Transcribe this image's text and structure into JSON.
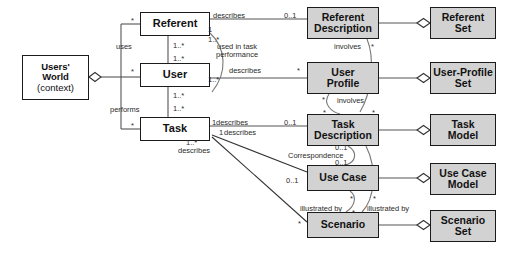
{
  "diagram": {
    "style": {
      "line_color": "#555555",
      "border_color": "#1b1b1b",
      "shaded_fill": "#d2d2d2",
      "plain_fill": "#ffffff",
      "background": "#ffffff"
    },
    "nodes": [
      {
        "id": "users_world",
        "label": "Users'",
        "label2": "World",
        "label3": "(context)",
        "shaded": false,
        "x": 22,
        "y": 55,
        "w": 67,
        "h": 45,
        "font": 9.5
      },
      {
        "id": "referent",
        "label": "Referent",
        "shaded": false,
        "x": 140,
        "y": 12,
        "w": 70,
        "h": 24,
        "font": 11
      },
      {
        "id": "user",
        "label": "User",
        "shaded": false,
        "x": 140,
        "y": 63,
        "w": 70,
        "h": 24,
        "font": 11
      },
      {
        "id": "task",
        "label": "Task",
        "shaded": false,
        "x": 140,
        "y": 117,
        "w": 70,
        "h": 24,
        "font": 11
      },
      {
        "id": "referent_desc",
        "label": "Referent",
        "label2": "Description",
        "shaded": true,
        "x": 307,
        "y": 7,
        "w": 72,
        "h": 32,
        "font": 10.5
      },
      {
        "id": "user_profile",
        "label": "User",
        "label2": "Profile",
        "shaded": true,
        "x": 307,
        "y": 62,
        "w": 72,
        "h": 32,
        "font": 10.5
      },
      {
        "id": "task_desc",
        "label": "Task",
        "label2": "Description",
        "shaded": true,
        "x": 307,
        "y": 114,
        "w": 72,
        "h": 32,
        "font": 10.5
      },
      {
        "id": "use_case",
        "label": "Use Case",
        "shaded": true,
        "x": 307,
        "y": 165,
        "w": 72,
        "h": 26,
        "font": 10.5
      },
      {
        "id": "scenario",
        "label": "Scenario",
        "shaded": true,
        "x": 307,
        "y": 212,
        "w": 72,
        "h": 26,
        "font": 10.5
      },
      {
        "id": "referent_set",
        "label": "Referent",
        "label2": "Set",
        "shaded": true,
        "x": 430,
        "y": 7,
        "w": 66,
        "h": 32,
        "font": 10.5
      },
      {
        "id": "user_profile_set",
        "label": "User-Profile",
        "label2": "Set",
        "shaded": true,
        "x": 430,
        "y": 62,
        "w": 66,
        "h": 32,
        "font": 10.5
      },
      {
        "id": "task_model",
        "label": "Task",
        "label2": "Model",
        "shaded": true,
        "x": 430,
        "y": 114,
        "w": 66,
        "h": 32,
        "font": 10.5
      },
      {
        "id": "use_case_model",
        "label": "Use Case",
        "label2": "Model",
        "shaded": true,
        "x": 430,
        "y": 163,
        "w": 66,
        "h": 32,
        "font": 10.5
      },
      {
        "id": "scenario_set",
        "label": "Scenario",
        "label2": "Set",
        "shaded": true,
        "x": 430,
        "y": 210,
        "w": 66,
        "h": 32,
        "font": 10.5
      }
    ],
    "relation_labels": [
      {
        "id": "uses",
        "text": "uses",
        "x": 116,
        "y": 42,
        "font": 7.5
      },
      {
        "id": "performs",
        "text": "performs",
        "x": 110,
        "y": 105,
        "font": 7.5
      },
      {
        "id": "describes_referent",
        "text": "describes",
        "x": 213,
        "y": 11,
        "font": 7.5
      },
      {
        "id": "used_in_task_perf",
        "text": "used in task\nperformance",
        "x": 216,
        "y": 43,
        "font": 7.5,
        "two_line": true
      },
      {
        "id": "describes_user",
        "text": "describes",
        "x": 229,
        "y": 66,
        "font": 7.5
      },
      {
        "id": "describes_task",
        "text": "describes",
        "x": 216,
        "y": 118,
        "font": 7.5
      },
      {
        "id": "describes_usecase",
        "text": "describes",
        "x": 224,
        "y": 128,
        "font": 7.5
      },
      {
        "id": "describes_scenario",
        "text": "describes",
        "x": 178,
        "y": 146,
        "font": 7.5
      },
      {
        "id": "involves_top",
        "text": "involves",
        "x": 334,
        "y": 42,
        "font": 7.5
      },
      {
        "id": "involves_bottom",
        "text": "involves",
        "x": 337,
        "y": 96,
        "font": 7.5
      },
      {
        "id": "correspondence",
        "text": "Correspondence",
        "x": 288,
        "y": 151,
        "font": 7.5
      },
      {
        "id": "illustrated_by_left",
        "text": "illustrated by",
        "x": 300,
        "y": 204,
        "font": 7.5
      },
      {
        "id": "illustrated_by_right",
        "text": "illustrated by",
        "x": 367,
        "y": 204,
        "font": 7.5
      }
    ],
    "multiplicities": [
      {
        "id": "m_ref_left",
        "text": "*",
        "x": 131,
        "y": 16,
        "font": 7.5
      },
      {
        "id": "m_user_left",
        "text": "*",
        "x": 131,
        "y": 67,
        "font": 7.5
      },
      {
        "id": "m_task_left",
        "text": "*",
        "x": 131,
        "y": 121,
        "font": 7.5
      },
      {
        "id": "m_uses_top",
        "text": "1..*",
        "x": 173,
        "y": 41,
        "font": 7.5
      },
      {
        "id": "m_uses_bot",
        "text": "1..*",
        "x": 173,
        "y": 54,
        "font": 7.5
      },
      {
        "id": "m_perf_top",
        "text": "1..*",
        "x": 173,
        "y": 91,
        "font": 7.5
      },
      {
        "id": "m_perf_bot",
        "text": "1..*",
        "x": 173,
        "y": 104,
        "font": 7.5
      },
      {
        "id": "m_ref_desc_1",
        "text": "1",
        "x": 208,
        "y": 25,
        "font": 7.5
      },
      {
        "id": "m_ref_desc_star",
        "text": "1..*",
        "x": 208,
        "y": 35,
        "font": 7.5
      },
      {
        "id": "m_ref_desc_01",
        "text": "0..1",
        "x": 284,
        "y": 11,
        "font": 7.5
      },
      {
        "id": "m_user_prof_1",
        "text": "1..*",
        "x": 208,
        "y": 75,
        "font": 7.5
      },
      {
        "id": "m_user_prof_star",
        "text": "*",
        "x": 297,
        "y": 66,
        "font": 7.5
      },
      {
        "id": "m_task_desc_1",
        "text": "1",
        "x": 212,
        "y": 118,
        "font": 7.5
      },
      {
        "id": "m_task_desc_01",
        "text": "0..1",
        "x": 284,
        "y": 118,
        "font": 7.5
      },
      {
        "id": "m_task_uc_1",
        "text": "1",
        "x": 219,
        "y": 128,
        "font": 7.5
      },
      {
        "id": "m_task_sc_star",
        "text": "1..*",
        "x": 186,
        "y": 138,
        "font": 7.5
      },
      {
        "id": "m_corr_top",
        "text": "0..1",
        "x": 335,
        "y": 143,
        "font": 7.5
      },
      {
        "id": "m_corr_bot",
        "text": "0..1",
        "x": 335,
        "y": 158,
        "font": 7.5
      },
      {
        "id": "m_uc_left_01",
        "text": "0..1",
        "x": 286,
        "y": 176,
        "font": 7.5
      },
      {
        "id": "m_inv_top_star",
        "text": "*",
        "x": 371,
        "y": 42,
        "font": 7.5
      },
      {
        "id": "m_inv_up_star",
        "text": "*",
        "x": 322,
        "y": 95,
        "font": 7.5
      },
      {
        "id": "m_inv_dn_star",
        "text": "*",
        "x": 323,
        "y": 108,
        "font": 7.5
      },
      {
        "id": "m_inv_r_star",
        "text": "*",
        "x": 372,
        "y": 108,
        "font": 7.5
      },
      {
        "id": "m_uc_bot_star",
        "text": "*",
        "x": 350,
        "y": 194,
        "font": 7.5
      },
      {
        "id": "m_sc_in_star",
        "text": "*",
        "x": 352,
        "y": 208,
        "font": 7.5
      },
      {
        "id": "m_sc_r_star",
        "text": "*",
        "x": 373,
        "y": 194,
        "font": 7.5
      },
      {
        "id": "m_sc_left_star",
        "text": "*",
        "x": 298,
        "y": 219,
        "font": 7.5
      }
    ]
  }
}
